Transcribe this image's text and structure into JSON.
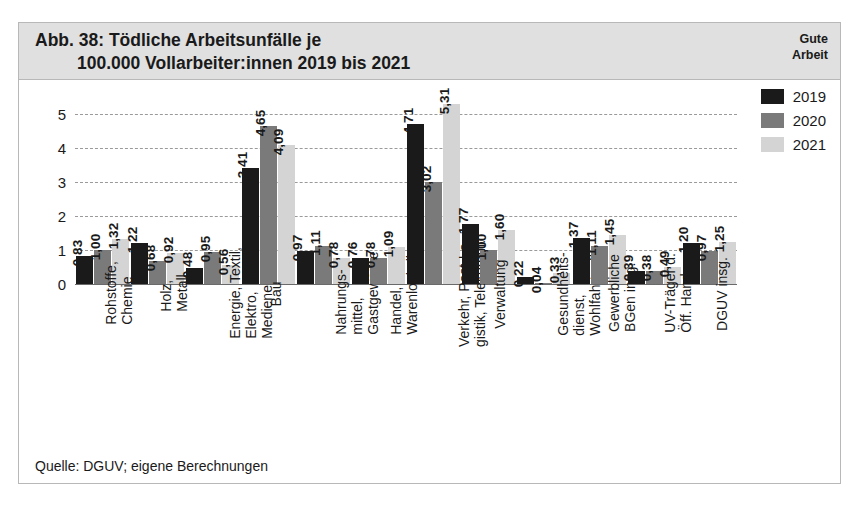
{
  "header": {
    "title_line1": "Abb. 38: Tödliche Arbeitsunfälle je",
    "title_line2": "100.000 Vollarbeiter:innen 2019 bis 2021",
    "brand_line1": "Gute",
    "brand_line2": "Arbeit"
  },
  "source": "Quelle: DGUV; eigene Berechnungen",
  "colors": {
    "series_2019": "#1a1a1a",
    "series_2020": "#7a7a7a",
    "series_2021": "#d4d4d4",
    "header_bg": "#e0e0e0",
    "frame_border": "#b8b8b8",
    "gridline": "#9a9a9a"
  },
  "chart_data": {
    "type": "bar",
    "title": "Abb. 38: Tödliche Arbeitsunfälle je 100.000 Vollarbeiter:innen 2019 bis 2021",
    "xlabel": "",
    "ylabel": "",
    "ylim": [
      0,
      5.6
    ],
    "yticks": [
      "0",
      "1",
      "2",
      "3",
      "4",
      "5"
    ],
    "ytick_values": [
      0,
      1,
      2,
      3,
      4,
      5
    ],
    "grid": true,
    "legend_position": "top-right",
    "categories": [
      "Rohstoffe,\nChemie",
      "Holz,\nMetall",
      "Energie, Textil,\nElektro,\nMedienerz.",
      "Bau",
      "Nahrungs-\nmittel,\nGastgewerbe",
      "Handel,\nWarenlogistik",
      "Verkehr, Post-Lo-\ngistik, Telekomm.",
      "Verwaltung",
      "Gesundheits-\ndienst,\nWohlfahrtspfl.",
      "Gewerbliche\nBGen insg.",
      "UV-Träger d.\nÖff. Hand",
      "DGUV insg."
    ],
    "category_lines": [
      [
        "Rohstoffe,",
        "Chemie"
      ],
      [
        "Holz,",
        "Metall"
      ],
      [
        "Energie, Textil,",
        "Elektro,",
        "Medienerz."
      ],
      [
        "Bau"
      ],
      [
        "Nahrungs-",
        "mittel,",
        "Gastgewerbe"
      ],
      [
        "Handel,",
        "Warenlogistik"
      ],
      [
        "Verkehr, Post-Lo-",
        "gistik, Telekomm."
      ],
      [
        "Verwaltung"
      ],
      [
        "Gesundheits-",
        "dienst,",
        "Wohlfahrtspfl."
      ],
      [
        "Gewerbliche",
        "BGen insg."
      ],
      [
        "UV-Träger d.",
        "Öff. Hand"
      ],
      [
        "DGUV insg."
      ]
    ],
    "series": [
      {
        "name": "2019",
        "color": "#1a1a1a",
        "values": [
          0.83,
          1.22,
          0.48,
          3.41,
          0.97,
          0.76,
          4.71,
          1.77,
          0.22,
          1.37,
          0.39,
          1.2
        ],
        "labels": [
          "0,83",
          "1,22",
          "0,48",
          "3,41",
          "0,97",
          "0,76",
          "4,71",
          "1,77",
          "0,22",
          "1,37",
          "0,39",
          "1,20"
        ]
      },
      {
        "name": "2020",
        "color": "#7a7a7a",
        "values": [
          1.0,
          0.68,
          0.95,
          4.65,
          1.11,
          0.78,
          3.02,
          1.0,
          0.04,
          1.11,
          0.38,
          0.97
        ],
        "labels": [
          "1,00",
          "0,68",
          "0,95",
          "4,65",
          "1,11",
          "0,78",
          "3,02",
          "1,00",
          "0,04",
          "1,11",
          "0,38",
          "0,97"
        ]
      },
      {
        "name": "2021",
        "color": "#d4d4d4",
        "values": [
          1.32,
          0.92,
          0.56,
          4.09,
          0.78,
          1.09,
          5.31,
          1.6,
          0.33,
          1.45,
          0.49,
          1.25
        ],
        "labels": [
          "1,32",
          "0,92",
          "0,56",
          "4,09",
          "0,78",
          "1,09",
          "5,31",
          "1,60",
          "0,33",
          "1,45",
          "0,49",
          "1,25"
        ]
      }
    ]
  }
}
